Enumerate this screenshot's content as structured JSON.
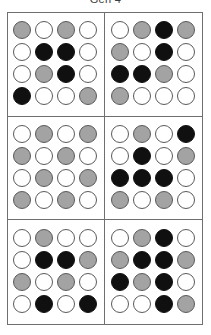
{
  "figure": {
    "title": "Gen 4",
    "colors": {
      "white": "#ffffff",
      "gray": "#a3a3a3",
      "black": "#101010",
      "outline": "#5a5a5a",
      "frame": "#6f6f6f"
    },
    "grid_layout": {
      "rows": 3,
      "cols": 2,
      "panel_count": 6
    },
    "matrix_size": {
      "rows": 4,
      "cols": 4
    },
    "state_legend": {
      "white": "empty",
      "gray": "partial",
      "black": "filled"
    }
  },
  "chart_data": {
    "type": "heatmap",
    "title": "Gen 4",
    "xlabel": "",
    "ylabel": "",
    "categories": [
      "col-1",
      "col-2",
      "col-3",
      "col-4"
    ],
    "states": [
      "white",
      "gray",
      "black"
    ],
    "panels": [
      {
        "id": "panel-1",
        "position": "top-left",
        "rows": [
          [
            "gray",
            "white",
            "gray",
            "white"
          ],
          [
            "white",
            "black",
            "black",
            "white"
          ],
          [
            "white",
            "gray",
            "black",
            "white"
          ],
          [
            "black",
            "white",
            "white",
            "gray"
          ]
        ]
      },
      {
        "id": "panel-2",
        "position": "top-right",
        "rows": [
          [
            "white",
            "gray",
            "black",
            "gray"
          ],
          [
            "gray",
            "white",
            "black",
            "white"
          ],
          [
            "black",
            "black",
            "gray",
            "white"
          ],
          [
            "gray",
            "white",
            "white",
            "white"
          ]
        ]
      },
      {
        "id": "panel-3",
        "position": "middle-left",
        "rows": [
          [
            "white",
            "gray",
            "white",
            "gray"
          ],
          [
            "gray",
            "white",
            "gray",
            "white"
          ],
          [
            "white",
            "gray",
            "white",
            "gray"
          ],
          [
            "gray",
            "white",
            "gray",
            "white"
          ]
        ]
      },
      {
        "id": "panel-4",
        "position": "middle-right",
        "rows": [
          [
            "white",
            "gray",
            "white",
            "black"
          ],
          [
            "white",
            "black",
            "white",
            "gray"
          ],
          [
            "black",
            "black",
            "black",
            "white"
          ],
          [
            "gray",
            "white",
            "gray",
            "white"
          ]
        ]
      },
      {
        "id": "panel-5",
        "position": "bottom-left",
        "rows": [
          [
            "white",
            "gray",
            "white",
            "white"
          ],
          [
            "white",
            "black",
            "black",
            "gray"
          ],
          [
            "gray",
            "white",
            "gray",
            "white"
          ],
          [
            "white",
            "black",
            "white",
            "black"
          ]
        ]
      },
      {
        "id": "panel-6",
        "position": "bottom-right",
        "rows": [
          [
            "white",
            "gray",
            "black",
            "white"
          ],
          [
            "gray",
            "black",
            "black",
            "gray"
          ],
          [
            "black",
            "gray",
            "black",
            "white"
          ],
          [
            "white",
            "white",
            "black",
            "gray"
          ]
        ]
      }
    ]
  }
}
